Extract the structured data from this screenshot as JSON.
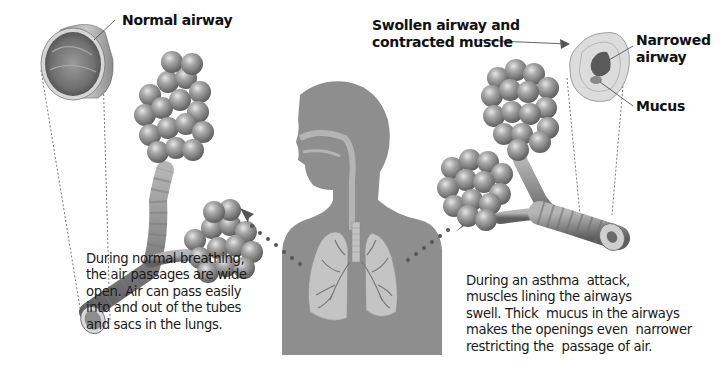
{
  "diagram": {
    "type": "anatomical-comparison",
    "panels": [
      {
        "id": "normal",
        "label": "Normal airway",
        "caption_lines": [
          "During normal breathing,",
          "the air passages are wide",
          "open. Air can pass easily",
          "into and out of the tubes",
          "and sacs in the lungs."
        ]
      },
      {
        "id": "asthma",
        "labels": {
          "swollen_line1": "Swollen airway and",
          "swollen_line2": "contracted muscle",
          "narrowed_line1": "Narrowed",
          "narrowed_line2": "airway",
          "mucus": "Mucus"
        },
        "caption_lines": [
          "During an asthma  attack,",
          "muscles lining the airways",
          "swell. Thick  mucus in the airways",
          "makes the openings even  narrower",
          "restricting the  passage of air."
        ]
      }
    ],
    "center": {
      "figure": "human silhouette with respiratory tract and lungs",
      "arrows": [
        "dotted arrow to normal bronchiole (left)",
        "dotted arrow to asthmatic bronchiole (right)"
      ]
    },
    "colors": {
      "background": "#ffffff",
      "silhouette": "#8e8e8e",
      "lungs": "#c4c4c4",
      "alveoli": "#8a8a8a",
      "arrow_dots": "#555555",
      "text": "#111111"
    }
  }
}
